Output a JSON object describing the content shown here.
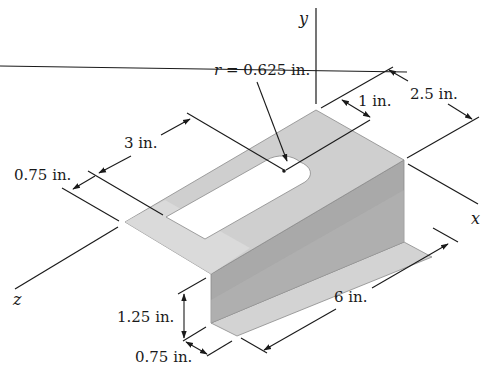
{
  "figure": {
    "type": "isometric-dimensioned-part",
    "colors": {
      "top_face": "#cfcfcf",
      "top_face_light": "#dcdcdc",
      "wall_face": "#a9a9a9",
      "flange_face": "#d3d3d3",
      "slot": "#ffffff",
      "lines": "#1a1a1a"
    }
  },
  "axes": {
    "x": "x",
    "y": "y",
    "z": "z"
  },
  "dimensions": {
    "radius": {
      "symbol": "r",
      "equals": " = ",
      "value": "0.625 in."
    },
    "slot_offset_top": "1 in.",
    "plate_width": "2.5 in.",
    "slot_length": "3 in.",
    "slot_edge_offset": "0.75 in.",
    "wall_height": "1.25 in.",
    "flange_width": "0.75 in.",
    "length": "6 in."
  }
}
